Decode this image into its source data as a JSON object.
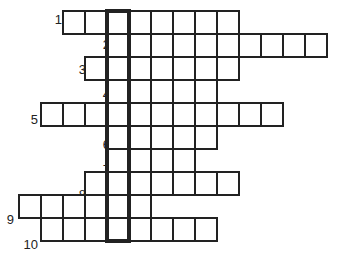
{
  "puzzle": {
    "type": "crossword",
    "highlighted_column": 4,
    "rows": [
      {
        "number": "1",
        "start_col": 2,
        "length": 8
      },
      {
        "number": "2",
        "start_col": 4,
        "length": 10
      },
      {
        "number": "3",
        "start_col": 3,
        "length": 7
      },
      {
        "number": "4",
        "start_col": 4,
        "length": 5
      },
      {
        "number": "5",
        "start_col": 1,
        "length": 11
      },
      {
        "number": "6",
        "start_col": 4,
        "length": 5
      },
      {
        "number": "7",
        "start_col": 4,
        "length": 4
      },
      {
        "number": "8",
        "start_col": 3,
        "length": 7
      },
      {
        "number": "9",
        "start_col": 0,
        "length": 6
      },
      {
        "number": "10",
        "start_col": 1,
        "length": 8
      }
    ]
  }
}
